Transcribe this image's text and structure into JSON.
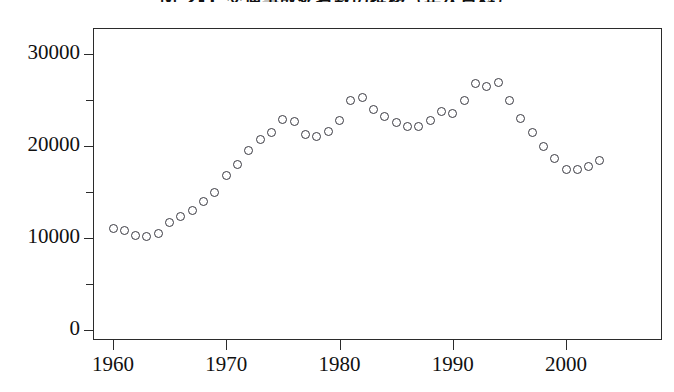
{
  "chart_data": {
    "type": "scatter",
    "title": "図 2-1  交通事故死者数の推移（年次資料）",
    "xlabel": "",
    "ylabel": "",
    "xlim": [
      1959,
      2004
    ],
    "ylim": [
      0,
      32000
    ],
    "grid": false,
    "legend": "none",
    "marker": "open-circle",
    "xticks": [
      1960,
      1970,
      1980,
      1990,
      2000
    ],
    "xtick_labels": [
      "1960",
      "1970",
      "1980",
      "1990",
      "2000"
    ],
    "yticks": [
      0,
      10000,
      20000,
      30000
    ],
    "ytick_labels": [
      "0",
      "10000",
      "20000",
      "30000"
    ],
    "yticks_minor": [
      5000,
      15000,
      25000
    ],
    "x": [
      1960,
      1961,
      1962,
      1963,
      1964,
      1965,
      1966,
      1967,
      1968,
      1969,
      1970,
      1971,
      1972,
      1973,
      1974,
      1975,
      1976,
      1977,
      1978,
      1979,
      1980,
      1981,
      1982,
      1983,
      1984,
      1985,
      1986,
      1987,
      1988,
      1989,
      1990,
      1991,
      1992,
      1993,
      1994,
      1995,
      1996,
      1997,
      1998,
      1999,
      2000,
      2001,
      2002,
      2003
    ],
    "values": [
      11000,
      10800,
      10300,
      10200,
      10500,
      11700,
      12300,
      13000,
      14000,
      15000,
      16800,
      18000,
      19500,
      20700,
      21500,
      22900,
      22700,
      21300,
      21000,
      21600,
      22800,
      24900,
      25300,
      24000,
      23200,
      22600,
      22100,
      22100,
      22800,
      23800,
      23500,
      25000,
      26800,
      26500,
      26900,
      25000,
      23000,
      21500,
      20000,
      18600,
      17500,
      17400,
      17800,
      18400
    ],
    "series": [
      {
        "name": "死者数",
        "values": [
          11000,
          10800,
          10300,
          10200,
          10500,
          11700,
          12300,
          13000,
          14000,
          15000,
          16800,
          18000,
          19500,
          20700,
          21500,
          22900,
          22700,
          21300,
          21000,
          21600,
          22800,
          24900,
          25300,
          24000,
          23200,
          22600,
          22100,
          22100,
          22800,
          23800,
          23500,
          25000,
          26800,
          26500,
          26900,
          25000,
          23000,
          21500,
          20000,
          18600,
          17500,
          17400,
          17800,
          18400
        ]
      }
    ]
  }
}
